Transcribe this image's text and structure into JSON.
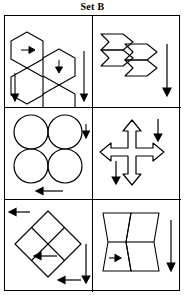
{
  "page": {
    "title": "Set B",
    "type": "geometric-reasoning-puzzle",
    "grid": {
      "rows": 3,
      "columns": 2,
      "border_color": "#000000",
      "background": "#ffffff"
    }
  },
  "cells": [
    {
      "id": "cell-1",
      "position": "row1-left",
      "shape_name": "hexagon-cluster",
      "shape_count": 4,
      "description": "Four hexagons in a staggered two-by-two cluster",
      "inner_arrows": [
        {
          "name": "right-arrow",
          "direction": "right",
          "location": "upper-left-hexagon"
        },
        {
          "name": "down-arrow",
          "direction": "down",
          "location": "upper-right-hexagon"
        }
      ],
      "outer_arrows": [
        {
          "name": "down-arrow",
          "direction": "down",
          "location": "left-side"
        },
        {
          "name": "down-arrow",
          "direction": "down",
          "location": "right-side"
        }
      ]
    },
    {
      "id": "cell-2",
      "position": "row1-right",
      "shape_name": "chevron-cluster",
      "shape_count": 4,
      "description": "Four flattened chevron arrow shapes stacked in a staggered cluster",
      "inner_arrows": [],
      "outer_arrows": [
        {
          "name": "down-arrow",
          "direction": "down",
          "location": "right-side"
        }
      ]
    },
    {
      "id": "cell-3",
      "position": "row2-left",
      "shape_name": "circle-cluster",
      "shape_count": 4,
      "description": "Four equal circles in a two-by-two arrangement",
      "inner_arrows": [],
      "outer_arrows": [
        {
          "name": "down-arrow",
          "direction": "down",
          "location": "right-side"
        },
        {
          "name": "left-arrow",
          "direction": "left",
          "location": "bottom"
        }
      ]
    },
    {
      "id": "cell-4",
      "position": "row2-right",
      "shape_name": "four-way-cross-arrow",
      "shape_count": 1,
      "description": "Outlined four-headed cross arrow pointing up, down, left and right",
      "inner_arrows": [],
      "outer_arrows": [
        {
          "name": "down-arrow",
          "direction": "down",
          "location": "top-right"
        },
        {
          "name": "down-arrow",
          "direction": "down",
          "location": "bottom-left"
        }
      ]
    },
    {
      "id": "cell-5",
      "position": "row3-left",
      "shape_name": "diamond-quartered",
      "shape_count": 4,
      "description": "Large diamond divided into four smaller diamonds",
      "inner_arrows": [
        {
          "name": "left-arrow",
          "direction": "left",
          "location": "lower-left-diamond"
        }
      ],
      "outer_arrows": [
        {
          "name": "left-arrow",
          "direction": "left",
          "location": "top-left"
        },
        {
          "name": "left-arrow",
          "direction": "left",
          "location": "bottom-right"
        },
        {
          "name": "down-arrow",
          "direction": "down",
          "location": "right-side"
        }
      ]
    },
    {
      "id": "cell-6",
      "position": "row3-right",
      "shape_name": "vertical-hexagon-pair",
      "shape_count": 2,
      "description": "Two tall hexagons side by side, each split horizontally",
      "inner_arrows": [
        {
          "name": "right-arrow",
          "direction": "right",
          "location": "lower-left-hexagon"
        }
      ],
      "outer_arrows": [
        {
          "name": "down-arrow",
          "direction": "down",
          "location": "right-side"
        }
      ]
    }
  ]
}
